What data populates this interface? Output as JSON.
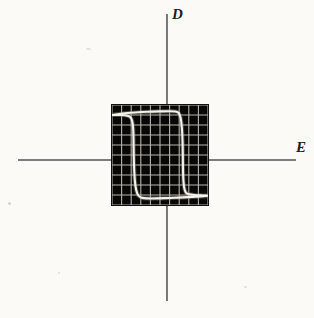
{
  "figure": {
    "kind": "oscilloscope-photograph",
    "background_color": "#fbfaf7",
    "axis_color": "#5d5d5d",
    "trace_color": "#f4f2ea",
    "screen_color": "#070707",
    "grid_color": "#c9c5b8"
  },
  "axes": {
    "vertical": {
      "label": "D",
      "x": 167,
      "y_top": 14,
      "y_bottom": 301
    },
    "horizontal": {
      "label": "E",
      "y": 160,
      "x_left": 18,
      "x_right": 296
    },
    "label_positions": {
      "D": {
        "x": 172,
        "y": 8
      },
      "E": {
        "x": 297,
        "y": 140
      }
    }
  },
  "scope": {
    "x": 112,
    "y": 105,
    "width": 96,
    "height": 100,
    "grid_columns": 10,
    "grid_rows": 10
  },
  "chart_data": {
    "type": "line",
    "title": "",
    "xlabel": "E",
    "ylabel": "D",
    "grid": true,
    "legend": null,
    "xlim": [
      -5,
      5
    ],
    "ylim": [
      -5,
      5
    ],
    "annotations": [
      "Square hysteresis loop with sharp switching at the coercive field",
      "Flat saturation branches at positive and negative remanent displacement"
    ],
    "series": [
      {
        "name": "hysteresis-loop",
        "closed": true,
        "comment": "Traversal: upper saturation branch rightward, descending riser at positive coercive field, lower branch leftward, ascending riser at negative coercive field.",
        "points": [
          [
            -5.0,
            4.0
          ],
          [
            -3.9,
            4.15
          ],
          [
            -2.6,
            4.25
          ],
          [
            -1.3,
            4.32
          ],
          [
            0.0,
            4.36
          ],
          [
            1.0,
            4.38
          ],
          [
            1.6,
            4.35
          ],
          [
            1.95,
            4.2
          ],
          [
            2.15,
            3.7
          ],
          [
            2.28,
            2.7
          ],
          [
            2.35,
            1.3
          ],
          [
            2.38,
            -0.2
          ],
          [
            2.4,
            -1.6
          ],
          [
            2.45,
            -2.7
          ],
          [
            2.55,
            -3.4
          ],
          [
            2.72,
            -3.78
          ],
          [
            3.0,
            -3.92
          ],
          [
            3.6,
            -4.0
          ],
          [
            4.4,
            -4.05
          ],
          [
            5.0,
            -4.08
          ],
          [
            3.8,
            -4.16
          ],
          [
            2.4,
            -4.24
          ],
          [
            1.0,
            -4.3
          ],
          [
            -0.4,
            -4.34
          ],
          [
            -1.3,
            -4.34
          ],
          [
            -1.9,
            -4.28
          ],
          [
            -2.25,
            -4.05
          ],
          [
            -2.48,
            -3.5
          ],
          [
            -2.62,
            -2.55
          ],
          [
            -2.7,
            -1.2
          ],
          [
            -2.74,
            0.2
          ],
          [
            -2.76,
            1.6
          ],
          [
            -2.8,
            2.7
          ],
          [
            -2.9,
            3.4
          ],
          [
            -3.08,
            3.78
          ],
          [
            -3.4,
            3.93
          ],
          [
            -4.1,
            4.0
          ],
          [
            -5.0,
            4.0
          ]
        ]
      }
    ]
  }
}
